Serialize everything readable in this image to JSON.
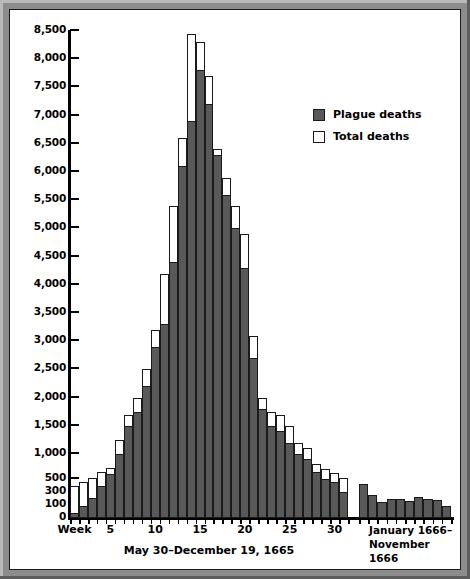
{
  "chart_data": {
    "type": "bar",
    "title": "",
    "subtitle": "",
    "xlabel": "May 30–December 19, 1665",
    "xlabel2": "January 1666–\nNovember 1666",
    "ylabel": "",
    "grid": false,
    "legend_position": "upper-right",
    "axis_note": "Non-linear y-axis: compressed below 500 (ticks at 0, 100, 300, 500) then linear 500-unit steps to 8,500",
    "y_ticks": [
      "0",
      "100",
      "300",
      "500",
      "1,000",
      "1,500",
      "2,000",
      "2,500",
      "3,000",
      "3,500",
      "4,000",
      "4,500",
      "5,000",
      "5,500",
      "6,000",
      "6,500",
      "7,000",
      "7,500",
      "8,000",
      "8,500"
    ],
    "ylim": [
      0,
      8500
    ],
    "x_tick_labels": [
      "Week",
      "5",
      "10",
      "15",
      "20",
      "25",
      "30"
    ],
    "x_tick_weeks": [
      1,
      5,
      10,
      15,
      20,
      25,
      30
    ],
    "categories_1665": [
      1,
      2,
      3,
      4,
      5,
      6,
      7,
      8,
      9,
      10,
      11,
      12,
      13,
      14,
      15,
      16,
      17,
      18,
      19,
      20,
      21,
      22,
      23,
      24,
      25,
      26,
      27,
      28,
      29,
      30,
      31
    ],
    "series": [
      {
        "name": "Plague deaths",
        "color": "#595959",
        "values_1665": [
          40,
          90,
          210,
          400,
          600,
          1000,
          1500,
          1750,
          2200,
          2900,
          3300,
          4400,
          6100,
          6900,
          7800,
          7200,
          6300,
          5600,
          5000,
          4300,
          2700,
          1800,
          1500,
          1400,
          1200,
          1000,
          900,
          650,
          500,
          450,
          300
        ],
        "values_1666": [
          420,
          250,
          150,
          190,
          200,
          160,
          220,
          200,
          170,
          90
        ]
      },
      {
        "name": "Total deaths",
        "color": "#ffffff",
        "values_1665": [
          400,
          450,
          530,
          650,
          720,
          1250,
          1700,
          2000,
          2500,
          3200,
          4200,
          5400,
          6600,
          8450,
          8300,
          7700,
          6400,
          5900,
          5400,
          4900,
          3100,
          2000,
          1750,
          1700,
          1500,
          1200,
          1100,
          800,
          700,
          620,
          520
        ],
        "values_1666": [
          420,
          250,
          150,
          190,
          200,
          160,
          220,
          200,
          170,
          90
        ]
      }
    ]
  },
  "legend": {
    "items": [
      {
        "label": "Plague deaths",
        "style": "filled"
      },
      {
        "label": "Total deaths",
        "style": "empty"
      }
    ]
  },
  "axis": {
    "week_label": "Week",
    "caption_1665": "May 30–December 19, 1665",
    "caption_1666_line1": "January 1666–",
    "caption_1666_line2": "November 1666"
  }
}
